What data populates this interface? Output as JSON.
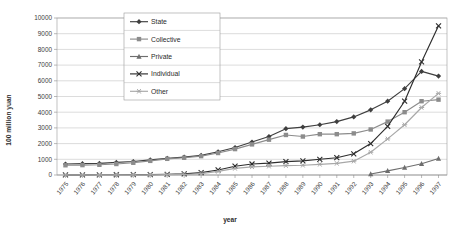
{
  "chart_data": {
    "type": "line",
    "title": "",
    "xlabel": "year",
    "ylabel": "100 million yuan",
    "grid": "horizontal",
    "legend_position": "upper-left-inside",
    "xlim": [
      1975,
      1997
    ],
    "ylim": [
      0,
      10000
    ],
    "ytick_step": 1000,
    "yticks": [
      "0",
      "1000",
      "2000",
      "3000",
      "4000",
      "5000",
      "6000",
      "7000",
      "8000",
      "9000",
      "10000"
    ],
    "categories": [
      "1975",
      "1976",
      "1977",
      "1978",
      "1979",
      "1980",
      "1981",
      "1982",
      "1983",
      "1984",
      "1985",
      "1986",
      "1987",
      "1988",
      "1989",
      "1990",
      "1991",
      "1992",
      "1993",
      "1994",
      "1995",
      "1996",
      "1997"
    ],
    "series": [
      {
        "name": "State",
        "marker": "diamond",
        "color": "#3f3f3f",
        "values": [
          700,
          720,
          740,
          800,
          860,
          960,
          1060,
          1140,
          1250,
          1480,
          1750,
          2100,
          2450,
          2950,
          3050,
          3200,
          3400,
          3700,
          4150,
          4700,
          5500,
          6600,
          6300
        ]
      },
      {
        "name": "Collective",
        "marker": "square",
        "color": "#8c8c8c",
        "values": [
          620,
          630,
          650,
          700,
          780,
          900,
          1030,
          1100,
          1200,
          1400,
          1650,
          1950,
          2250,
          2550,
          2450,
          2600,
          2600,
          2650,
          2900,
          3400,
          4000,
          4700,
          4800
        ]
      },
      {
        "name": "Private",
        "marker": "triangle",
        "color": "#6e6e6e",
        "values": [
          0,
          0,
          0,
          0,
          0,
          0,
          0,
          0,
          0,
          0,
          0,
          0,
          0,
          0,
          0,
          0,
          0,
          0,
          60,
          260,
          480,
          720,
          1050
        ]
      },
      {
        "name": "Individual",
        "marker": "x",
        "color": "#2d2d2d",
        "values": [
          10,
          12,
          14,
          16,
          20,
          28,
          40,
          70,
          150,
          320,
          560,
          700,
          760,
          850,
          900,
          1000,
          1100,
          1350,
          2000,
          3100,
          4700,
          7200,
          9500
        ]
      },
      {
        "name": "Other",
        "marker": "star",
        "color": "#a8a8a8",
        "values": [
          5,
          6,
          7,
          8,
          10,
          14,
          20,
          35,
          90,
          230,
          420,
          520,
          560,
          600,
          620,
          680,
          740,
          880,
          1450,
          2300,
          3200,
          4300,
          5200
        ]
      }
    ]
  }
}
